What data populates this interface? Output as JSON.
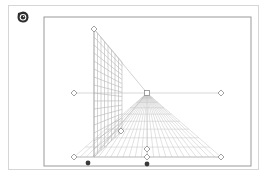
{
  "app": {
    "logo_icon": "perspective-tool-icon"
  },
  "canvas": {
    "frame": {
      "x": 44,
      "y": 17,
      "w": 207,
      "h": 149,
      "color": "#9a9a9a"
    },
    "horizon": {
      "y": 93,
      "x1": 74,
      "x2": 221,
      "color": "#d8d8d8"
    },
    "vanishing_point": {
      "x": 147,
      "y": 93
    },
    "wall": {
      "left_x": 94,
      "top_y": 29,
      "bottom_y": 157,
      "right_top": {
        "x": 122,
        "y": 62
      },
      "right_bottom": {
        "x": 122,
        "y": 131
      },
      "rows": 16,
      "cols": 8,
      "color": "#b5b5b5"
    },
    "floor": {
      "left_x": 74,
      "right_x": 221,
      "bottom_y": 157,
      "rays": 24,
      "rows": 10,
      "color": "#c4c4c4"
    },
    "handles": [
      {
        "name": "wall-top-handle",
        "x": 94,
        "y": 29
      },
      {
        "name": "horizon-left-handle",
        "x": 74,
        "y": 93
      },
      {
        "name": "horizon-right-handle",
        "x": 221,
        "y": 93
      },
      {
        "name": "vanishing-point-handle",
        "x": 147,
        "y": 93,
        "shape": "square"
      },
      {
        "name": "wall-base-handle",
        "x": 121,
        "y": 131
      },
      {
        "name": "floor-left-handle",
        "x": 74,
        "y": 157
      },
      {
        "name": "floor-right-handle",
        "x": 221,
        "y": 157
      },
      {
        "name": "floor-center-upper-handle",
        "x": 147,
        "y": 149
      },
      {
        "name": "floor-center-handle",
        "x": 147,
        "y": 157
      }
    ],
    "dot_handles": [
      {
        "name": "left-dot-handle",
        "x": 88,
        "y": 163
      },
      {
        "name": "center-dot-handle",
        "x": 147,
        "y": 164
      }
    ],
    "dot_color": "#3a3a3a"
  }
}
